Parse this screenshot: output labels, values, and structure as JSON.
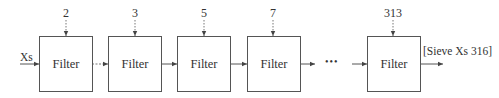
{
  "diagram": {
    "title": "",
    "input_label": "Xs",
    "output_label": "[Sieve Xs 316]",
    "ellipsis": "•••",
    "filters": [
      {
        "label": "Filter",
        "param": "2"
      },
      {
        "label": "Filter",
        "param": "3"
      },
      {
        "label": "Filter",
        "param": "5"
      },
      {
        "label": "Filter",
        "param": "7"
      },
      {
        "label": "Filter",
        "param": "313"
      }
    ],
    "colors": {
      "stroke": "#555555",
      "text": "#333333",
      "background": "#ffffff"
    }
  }
}
